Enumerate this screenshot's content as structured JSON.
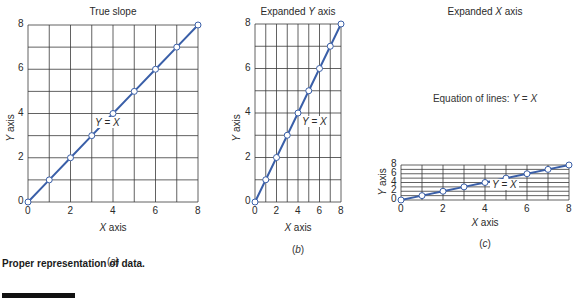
{
  "figure": {
    "caption": "Proper representation of data.",
    "line_color": "#3a5fa8",
    "grid_color": "#3a3a3a",
    "marker_fill": "#ffffff"
  },
  "chart_data": [
    {
      "type": "line",
      "panel": "(a)",
      "title": "True slope",
      "xlabel": "X axis",
      "ylabel": "Y axis",
      "annotation": "Y = X",
      "x": [
        0,
        1,
        2,
        3,
        4,
        5,
        6,
        7,
        8
      ],
      "series": [
        {
          "name": "Y = X",
          "values": [
            0,
            1,
            2,
            3,
            4,
            5,
            6,
            7,
            8
          ]
        }
      ],
      "xlim": [
        0,
        8
      ],
      "ylim": [
        0,
        8
      ],
      "xticks": [
        "0",
        "2",
        "4",
        "6",
        "8"
      ],
      "yticks": [
        "0",
        "2",
        "4",
        "6",
        "8"
      ],
      "grid": true
    },
    {
      "type": "line",
      "panel": "(b)",
      "title": "Expanded Y axis",
      "xlabel": "X axis",
      "ylabel": "Y axis",
      "annotation": "Y = X",
      "x": [
        0,
        1,
        2,
        3,
        4,
        5,
        6,
        7,
        8
      ],
      "series": [
        {
          "name": "Y = X",
          "values": [
            0,
            1,
            2,
            3,
            4,
            5,
            6,
            7,
            8
          ]
        }
      ],
      "xlim": [
        0,
        8
      ],
      "ylim": [
        0,
        8
      ],
      "xticks": [
        "0",
        "2",
        "4",
        "6",
        "8"
      ],
      "yticks": [
        "0",
        "2",
        "4",
        "6",
        "8"
      ],
      "grid": true
    },
    {
      "type": "line",
      "panel": "(c)",
      "title": "Expanded X axis",
      "subtitle": "Equation of lines: Y = X",
      "xlabel": "X axis",
      "ylabel": "Y axis",
      "annotation": "Y = X",
      "x": [
        0,
        1,
        2,
        3,
        4,
        5,
        6,
        7,
        8
      ],
      "series": [
        {
          "name": "Y = X",
          "values": [
            0,
            1,
            2,
            3,
            4,
            5,
            6,
            7,
            8
          ]
        }
      ],
      "xlim": [
        0,
        8
      ],
      "ylim": [
        0,
        8
      ],
      "xticks": [
        "0",
        "2",
        "4",
        "6",
        "8"
      ],
      "yticks": [
        "0",
        "2",
        "4",
        "6",
        "8"
      ],
      "grid": true
    }
  ]
}
